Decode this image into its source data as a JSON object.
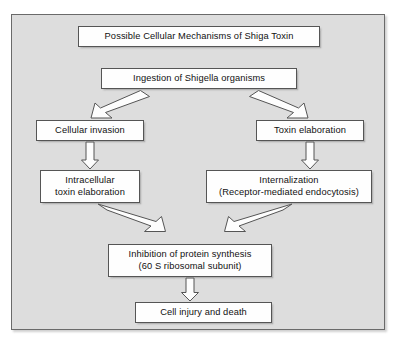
{
  "figure": {
    "kind": "flowchart",
    "title": "Possible Cellular Mechanisms of Shiga Toxin",
    "frame_background": "#dddddd",
    "node_background": "#fefefe",
    "node_border": "#555555",
    "arrow_stroke": "#555555"
  },
  "nodes": {
    "title": {
      "lines": [
        "Possible Cellular Mechanisms of Shiga Toxin"
      ]
    },
    "ingestion": {
      "lines": [
        "Ingestion of Shigella organisms"
      ]
    },
    "cellular_invasion": {
      "lines": [
        "Cellular invasion"
      ]
    },
    "toxin_elaboration": {
      "lines": [
        "Toxin elaboration"
      ]
    },
    "intracellular_toxin": {
      "lines": [
        "Intracellular",
        "toxin elaboration"
      ]
    },
    "internalization": {
      "lines": [
        "Internalization",
        "(Receptor-mediated endocytosis)"
      ]
    },
    "inhibition": {
      "lines": [
        "Inhibition of protein synthesis",
        "(60 S ribosomal subunit)"
      ]
    },
    "cell_injury": {
      "lines": [
        "Cell injury and death"
      ]
    }
  },
  "edges": [
    {
      "from": "ingestion",
      "to": "cellular_invasion",
      "style": "open-arrow-diagonal"
    },
    {
      "from": "ingestion",
      "to": "toxin_elaboration",
      "style": "open-arrow-diagonal"
    },
    {
      "from": "cellular_invasion",
      "to": "intracellular_toxin",
      "style": "open-arrow-vertical"
    },
    {
      "from": "toxin_elaboration",
      "to": "internalization",
      "style": "open-arrow-vertical"
    },
    {
      "from": "intracellular_toxin",
      "to": "inhibition",
      "style": "open-arrow-diagonal"
    },
    {
      "from": "internalization",
      "to": "inhibition",
      "style": "open-arrow-diagonal"
    },
    {
      "from": "inhibition",
      "to": "cell_injury",
      "style": "open-arrow-vertical"
    }
  ]
}
